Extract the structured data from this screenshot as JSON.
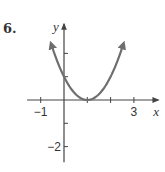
{
  "problem": {
    "number": "6."
  },
  "chart_data": {
    "type": "line",
    "title": "",
    "xlabel": "x",
    "ylabel": "y",
    "xlim": [
      -1.5,
      4
    ],
    "ylim": [
      -2.5,
      3.3
    ],
    "x_ticks": [
      -1,
      1,
      2,
      3
    ],
    "y_ticks": [
      -2,
      -1,
      1,
      2
    ],
    "x_tick_labels": [
      {
        "value": -1,
        "label": "−1"
      },
      {
        "value": 3,
        "label": "3"
      }
    ],
    "y_tick_labels": [
      {
        "value": -2,
        "label": "−2"
      }
    ],
    "grid": false,
    "series": [
      {
        "name": "parabola",
        "function": "(x-1)^2",
        "domain": [
          -0.55,
          2.55
        ],
        "arrows": "both",
        "color": "#6e6e6e",
        "sample_points": [
          {
            "x": -0.55,
            "y": 2.4
          },
          {
            "x": 0,
            "y": 1
          },
          {
            "x": 1,
            "y": 0
          },
          {
            "x": 2,
            "y": 1
          },
          {
            "x": 2.55,
            "y": 2.4
          }
        ]
      }
    ]
  }
}
